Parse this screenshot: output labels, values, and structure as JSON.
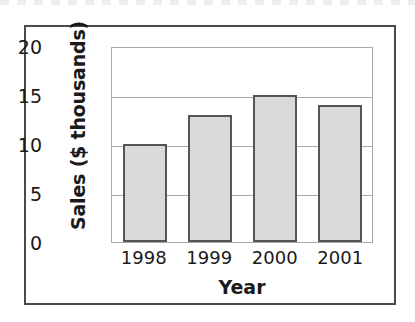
{
  "chart_data": {
    "type": "bar",
    "title": "",
    "categories": [
      "1998",
      "1999",
      "2000",
      "2001"
    ],
    "values": [
      10,
      13,
      15,
      14
    ],
    "series": [
      {
        "name": "Sales",
        "values": [
          10,
          13,
          15,
          14
        ]
      }
    ],
    "xlabel": "Year",
    "ylabel": "Sales ($ thousands)",
    "ylim": [
      0,
      20
    ],
    "yticks": [
      "0",
      "5",
      "10",
      "15",
      "20"
    ],
    "ytick_values": [
      0,
      5,
      10,
      15,
      20
    ],
    "grid": "horizontal",
    "legend": "none",
    "colors": {
      "bar_fill": "#d9d9d9",
      "bar_edge": "#555555",
      "gridline": "#a8a8a8",
      "plot_border": "#a8a8a8",
      "figure_border": "#4a4a4a",
      "text": "#1a1a1a",
      "background": "#ffffff"
    }
  }
}
